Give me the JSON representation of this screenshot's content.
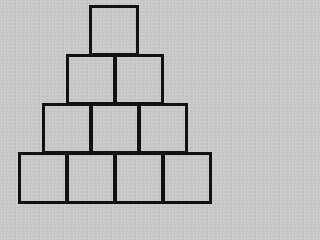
{
  "diagram": {
    "title": "",
    "line_color": "#111111",
    "background_color": "#c8c8c8",
    "rows": [
      {
        "count": 1,
        "left": 89,
        "top": 5,
        "cell_width": 50,
        "cell_height": 51
      },
      {
        "count": 2,
        "left": 66,
        "top": 54,
        "cell_width": 50,
        "cell_height": 51
      },
      {
        "count": 3,
        "left": 42,
        "top": 103,
        "cell_width": 50,
        "cell_height": 51
      },
      {
        "count": 4,
        "left": 18,
        "top": 152,
        "cell_width": 50,
        "cell_height": 52
      }
    ],
    "total_squares": 10
  }
}
